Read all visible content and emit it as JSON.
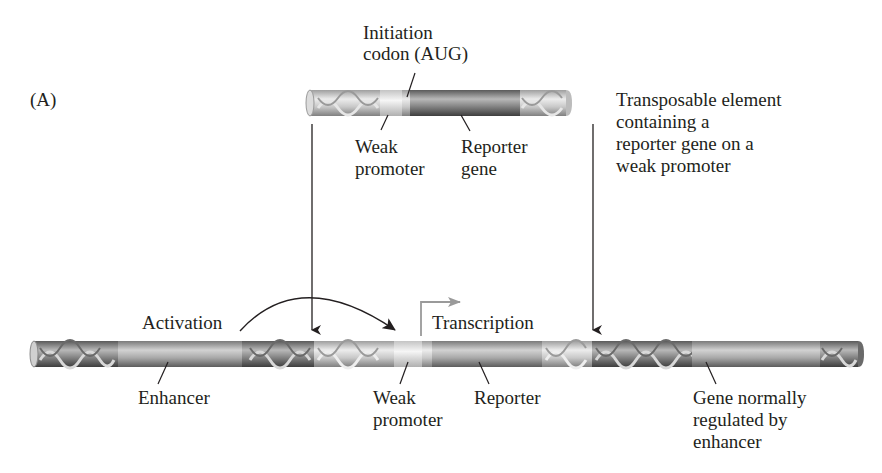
{
  "panel_label": "(A)",
  "transposable_element": {
    "callout_top": [
      "Initiation",
      "codon (AUG)"
    ],
    "weak_promoter_label": [
      "Weak",
      "promoter"
    ],
    "reporter_label": [
      "Reporter",
      "gene"
    ],
    "description": [
      "Transposable element",
      "containing a",
      "reporter gene on a",
      "weak promoter"
    ]
  },
  "chromosome": {
    "activation_label": "Activation",
    "transcription_label": "Transcription",
    "enhancer_label": "Enhancer",
    "weak_promoter_label": [
      "Weak",
      "promoter"
    ],
    "reporter_label": "Reporter",
    "gene_label": [
      "Gene normally",
      "regulated by",
      "enhancer"
    ]
  },
  "colors": {
    "dark_segment": "#7d7d7d",
    "mid_segment": "#a9a9a9",
    "light_segment": "#d4d4d4",
    "promoter_segment": "#ececec",
    "transcription_arrow": "#9a9a9a",
    "line": "#231f20"
  }
}
